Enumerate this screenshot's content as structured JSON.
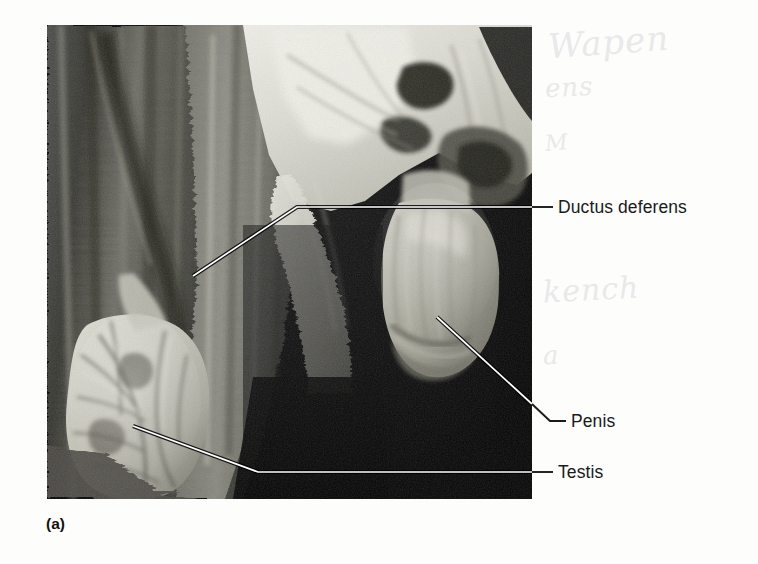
{
  "figure": {
    "caption": "(a)",
    "photo_alt": "greyscale-dissection-photograph-male-reproductive-organs",
    "background_color": "#ffffff",
    "photo_frame": {
      "left": 47,
      "top": 25,
      "width": 485,
      "height": 474,
      "void_color": "#000000"
    }
  },
  "labels": [
    {
      "id": "ductus-deferens",
      "text": "Ductus deferens",
      "color": "#1a1a1a",
      "leader": {
        "inside_color": "#ffffff",
        "outside_color": "#1a1a1a",
        "anchor_x": 193,
        "anchor_y": 276,
        "bend_x": 297,
        "bend_y": 207,
        "end_x": 553,
        "end_y": 207
      }
    },
    {
      "id": "penis",
      "text": "Penis",
      "color": "#1a1a1a",
      "leader": {
        "inside_color": "#ffffff",
        "outside_color": "#1a1a1a",
        "anchor_x": 437,
        "anchor_y": 317,
        "bend_x": 550,
        "bend_y": 421,
        "end_x": 566,
        "end_y": 421
      }
    },
    {
      "id": "testis",
      "text": "Testis",
      "color": "#1a1a1a",
      "leader": {
        "inside_color": "#ffffff",
        "outside_color": "#1a1a1a",
        "anchor_x": 133,
        "anchor_y": 426,
        "bend_x": 258,
        "bend_y": 472,
        "end_x": 553,
        "end_y": 472
      }
    }
  ],
  "marginalia": {
    "handwriting_bleed": [
      "Wapen",
      "ens",
      "M",
      "kench",
      "a"
    ]
  }
}
